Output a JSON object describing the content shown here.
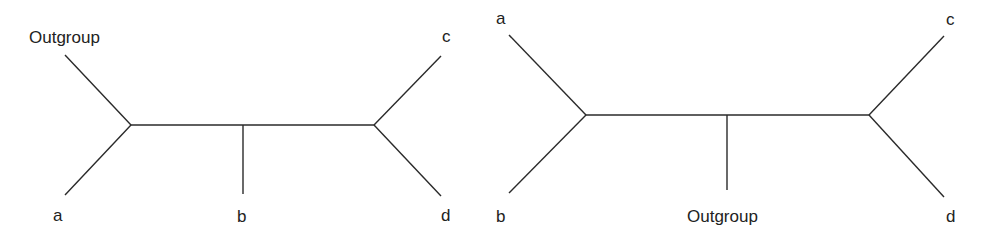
{
  "figure": {
    "type": "unrooted phylogenetic trees comparison",
    "stroke_color": "#2a2a2a",
    "trees": [
      {
        "name": "left-tree",
        "labels": {
          "outgroup": "Outgroup",
          "a": "a",
          "b": "b",
          "c": "c",
          "d": "d"
        }
      },
      {
        "name": "right-tree",
        "labels": {
          "a": "a",
          "b": "b",
          "outgroup": "Outgroup",
          "c": "c",
          "d": "d"
        }
      }
    ]
  }
}
